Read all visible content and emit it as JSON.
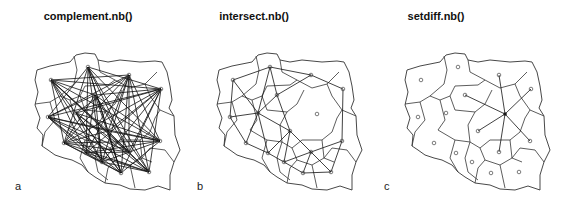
{
  "panels": [
    {
      "id": "a",
      "title": "complement.nb()",
      "label": "a",
      "offset_x": -370,
      "title_x": 88,
      "label_x": 15
    },
    {
      "id": "b",
      "title": "intersect.nb()",
      "label": "b",
      "offset_x": -188,
      "title_x": 254,
      "label_x": 197
    },
    {
      "id": "c",
      "title": "setdiff.nb()",
      "label": "c",
      "offset_x": 0,
      "title_x": 436,
      "label_x": 384
    }
  ],
  "regions": [
    {
      "name": "zachodniopomorskie",
      "x": 421,
      "y": 80
    },
    {
      "name": "pomorskie",
      "x": 458,
      "y": 67
    },
    {
      "name": "warminsko-mazurskie",
      "x": 499,
      "y": 75
    },
    {
      "name": "podlaskie",
      "x": 531,
      "y": 89
    },
    {
      "name": "kujawsko-pomorskie",
      "x": 465,
      "y": 95
    },
    {
      "name": "mazowieckie",
      "x": 505,
      "y": 114
    },
    {
      "name": "lubuskie",
      "x": 418,
      "y": 117
    },
    {
      "name": "wielkopolskie",
      "x": 446,
      "y": 113
    },
    {
      "name": "lodzkie",
      "x": 478,
      "y": 131
    },
    {
      "name": "lubelskie",
      "x": 530,
      "y": 141
    },
    {
      "name": "dolnoslaskie",
      "x": 434,
      "y": 143
    },
    {
      "name": "opolskie",
      "x": 456,
      "y": 153
    },
    {
      "name": "swietokrzyskie",
      "x": 499,
      "y": 152
    },
    {
      "name": "slaskie",
      "x": 472,
      "y": 162
    },
    {
      "name": "malopolskie",
      "x": 491,
      "y": 173
    },
    {
      "name": "podkarpackie",
      "x": 519,
      "y": 172
    }
  ],
  "adjacency": [
    [
      0,
      1
    ],
    [
      0,
      6
    ],
    [
      0,
      7
    ],
    [
      1,
      2
    ],
    [
      1,
      4
    ],
    [
      1,
      7
    ],
    [
      2,
      3
    ],
    [
      2,
      4
    ],
    [
      2,
      5
    ],
    [
      3,
      5
    ],
    [
      3,
      9
    ],
    [
      4,
      5
    ],
    [
      4,
      7
    ],
    [
      4,
      8
    ],
    [
      5,
      8
    ],
    [
      5,
      9
    ],
    [
      5,
      12
    ],
    [
      6,
      7
    ],
    [
      6,
      10
    ],
    [
      7,
      8
    ],
    [
      7,
      10
    ],
    [
      7,
      11
    ],
    [
      8,
      11
    ],
    [
      8,
      12
    ],
    [
      8,
      13
    ],
    [
      9,
      12
    ],
    [
      9,
      15
    ],
    [
      10,
      11
    ],
    [
      11,
      13
    ],
    [
      12,
      13
    ],
    [
      12,
      14
    ],
    [
      12,
      15
    ],
    [
      13,
      14
    ],
    [
      14,
      15
    ]
  ],
  "focus_region": 5
}
